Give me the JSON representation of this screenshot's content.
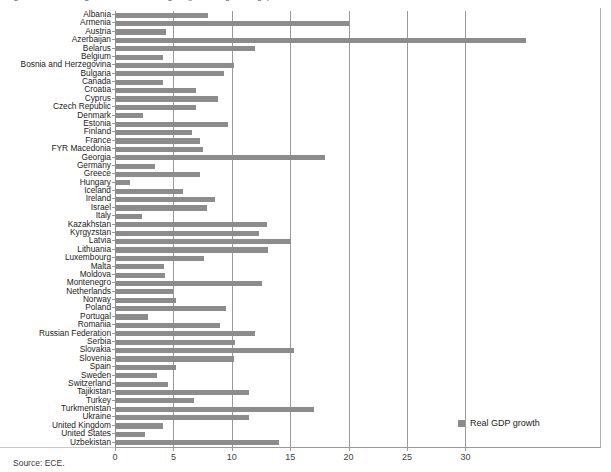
{
  "figure": {
    "title_clipped": "Figure 1  Real GDP growth in the ECE region (percentage change)",
    "source_note": "Source: ECE.",
    "bar_color": "#8c8c8c",
    "grid_color": "#9a9a9a",
    "axis_color": "#9a9a9a"
  },
  "legend": {
    "position": "bottom-right",
    "entries": [
      {
        "label": "Real GDP growth",
        "color": "#8c8c8c"
      }
    ]
  },
  "chart_data": {
    "type": "bar",
    "orientation": "horizontal",
    "title": "Real GDP growth",
    "xlabel": "",
    "ylabel": "",
    "xlim": [
      0,
      35
    ],
    "grid": true,
    "legend_position": "bottom-right",
    "xticks": [
      0,
      5,
      10,
      15,
      20,
      25,
      30
    ],
    "xticklabels": [
      "0",
      "5",
      "10",
      "15",
      "20",
      "25",
      "30"
    ],
    "series_name": "Real GDP growth",
    "categories": [
      "Albania",
      "Armenia",
      "Austria",
      "Azerbaijan",
      "Belarus",
      "Belgium",
      "Bosnia and Herzegovina",
      "Bulgaria",
      "Canada",
      "Croatia",
      "Cyprus",
      "Czech Republic",
      "Denmark",
      "Estonia",
      "Finland",
      "France",
      "FYR Macedonia",
      "Georgia",
      "Germany",
      "Greece",
      "Hungary",
      "Iceland",
      "Ireland",
      "Israel",
      "Italy",
      "Kazakhstan",
      "Kyrgyzstan",
      "Latvia",
      "Lithuania",
      "Luxembourg",
      "Malta",
      "Moldova",
      "Montenegro",
      "Netherlands",
      "Norway",
      "Poland",
      "Portugal",
      "Romania",
      "Russian Federation",
      "Serbia",
      "Slovakia",
      "Slovenia",
      "Spain",
      "Sweden",
      "Switzerland",
      "Tajikistan",
      "Turkey",
      "Turkmenistan",
      "Ukraine",
      "United Kingdom",
      "United States",
      "Uzbekistan"
    ],
    "values": [
      8.0,
      20.0,
      4.4,
      35.2,
      12.0,
      4.1,
      10.2,
      9.3,
      4.1,
      6.9,
      8.8,
      6.9,
      2.4,
      9.7,
      6.6,
      7.3,
      7.5,
      18.0,
      3.4,
      7.3,
      1.3,
      5.8,
      8.6,
      7.9,
      2.3,
      13.0,
      12.3,
      15.1,
      13.1,
      7.6,
      4.2,
      4.3,
      12.6,
      5.0,
      5.2,
      9.5,
      2.8,
      9.0,
      12.0,
      10.3,
      15.3,
      10.2,
      5.2,
      3.6,
      4.5,
      11.5,
      6.8,
      17.0,
      11.5,
      4.1,
      2.6,
      14.0
    ]
  }
}
